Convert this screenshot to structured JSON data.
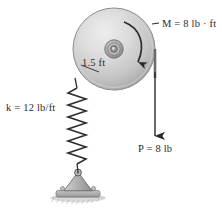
{
  "figure": {
    "kind": "statics-free-body-diagram",
    "background_color": "#ffffff"
  },
  "labels": {
    "moment": "M = 8 lb · ft",
    "moment_symbol": "M",
    "moment_value": "8 lb · ft",
    "spring": "k = 12 lb/ft",
    "spring_symbol": "k",
    "spring_value": "12 lb/ft",
    "radius": "1.5 ft",
    "radius_value": "1.5",
    "radius_unit": "ft",
    "force": "P = 8 lb",
    "force_symbol": "P",
    "force_value": "8 lb"
  },
  "geometry": {
    "disk_center_x": 114,
    "disk_center_y": 49,
    "disk_radius": 41,
    "hub_radius": 9,
    "spring_top_y": 78,
    "spring_bottom_y": 168,
    "support_base_y": 196,
    "cord_x": 155,
    "cord_arrow_tip_y": 140
  },
  "colors": {
    "disk_fill_light": "#e4e4e4",
    "disk_fill_mid": "#c9c9c9",
    "disk_fill_dark": "#a8a8a8",
    "disk_edge": "#8d8d8d",
    "hub_fill": "#9a9a9a",
    "line": "#3a3a3a",
    "text": "#2b2b2b",
    "support_fill": "#b5b5b5",
    "ground_fill": "#b0b0b0",
    "spring_stroke": "#2e2e2e"
  },
  "icons": {
    "moment_arrow": "curved-clockwise-arrow-icon",
    "force_arrow": "down-arrow-icon",
    "spring": "coil-spring-icon",
    "pin_support": "triangle-pin-support-icon",
    "ground_hatch": "ground-hatching-icon"
  }
}
